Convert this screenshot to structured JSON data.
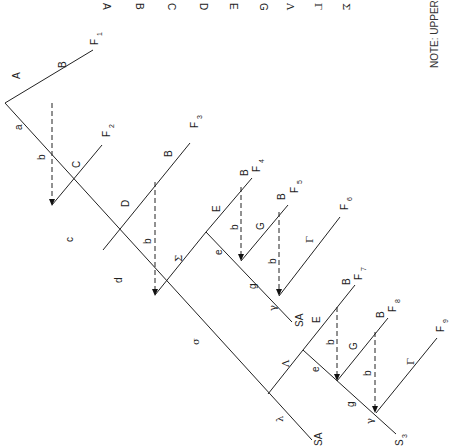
{
  "diagram": {
    "type": "synthesis tree (rotated 90 degrees)",
    "legend_letters": [
      "A",
      "B",
      "C",
      "D",
      "E",
      "G",
      "Λ",
      "Γ",
      "Σ"
    ],
    "note": "NOTE: UPPER-",
    "trunk_labels": [
      "a",
      "c",
      "d",
      "σ",
      "λ",
      "SA"
    ],
    "branches": [
      {
        "label": "A",
        "sub": "B",
        "end": "F1",
        "end_sub": "1"
      },
      {
        "label": "C",
        "end": "F2",
        "end_sub": "2"
      },
      {
        "label": "D",
        "sub": "B",
        "end": "F3",
        "end_sub": "3"
      },
      {
        "label": "Σ"
      },
      {
        "label": "E",
        "sub": "B",
        "end": "F4",
        "end_sub": "4"
      },
      {
        "label": "G",
        "sub": "B",
        "end": "F5",
        "end_sub": "5"
      },
      {
        "label": "Γ",
        "end": "F6",
        "end_sub": "6"
      },
      {
        "label": "Λ"
      },
      {
        "label": "E",
        "sub": "B",
        "end": "F7",
        "end_sub": "7"
      },
      {
        "label": "G",
        "sub": "B",
        "end": "F8",
        "end_sub": "8"
      },
      {
        "label": "Γ",
        "end": "F9",
        "end_sub": "9"
      }
    ],
    "sub_trunk_labels": {
      "first": [
        "e",
        "g",
        "γ",
        "SA"
      ],
      "second": [
        "e",
        "g",
        "γ",
        "S3"
      ]
    },
    "dashed_label": "b",
    "end_labels": {
      "F": "F",
      "S3": "S",
      "S3_sub": "3",
      "SA": "SA"
    }
  }
}
